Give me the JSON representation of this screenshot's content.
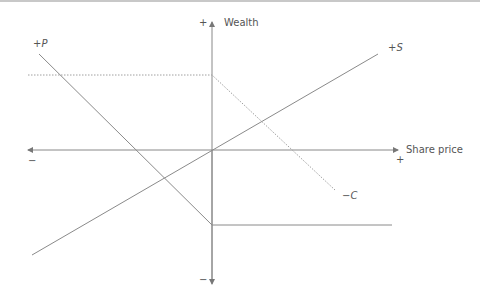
{
  "diagram": {
    "y_axis": {
      "label": "Wealth",
      "plus": "+",
      "minus": "−"
    },
    "x_axis": {
      "label": "Share price",
      "plus": "+",
      "minus": "−"
    },
    "series": [
      {
        "label": "+P",
        "style": "solid",
        "description": "long put payoff"
      },
      {
        "label": "+S",
        "style": "solid",
        "description": "long stock payoff"
      },
      {
        "label": "−C",
        "style": "dotted",
        "description": "short call payoff"
      }
    ],
    "colors": {
      "line": "#8a8a8a",
      "dotted": "#a0a0a0",
      "text": "#555555"
    }
  }
}
